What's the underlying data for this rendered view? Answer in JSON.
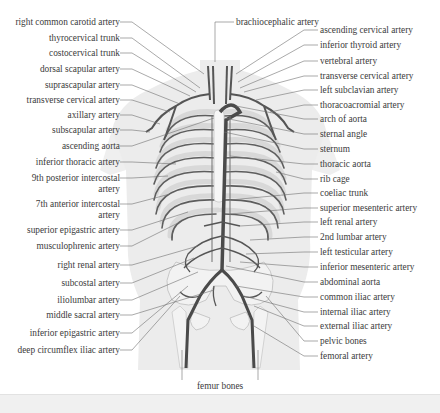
{
  "figure": {
    "colors": {
      "body_silhouette": "#ececec",
      "arteries": "#5a5a5a",
      "bones": "#f4f4f4",
      "bone_outline": "#bdbdbd",
      "leader_lines": "#6a6a6a",
      "text": "#3b3b3b"
    },
    "left_labels": [
      {
        "text": "right common carotid artery",
        "y": 22
      },
      {
        "text": "thyrocervical trunk",
        "y": 38
      },
      {
        "text": "costocervical trunk",
        "y": 53
      },
      {
        "text": "dorsal scapular artery",
        "y": 69
      },
      {
        "text": "suprascapular artery",
        "y": 85
      },
      {
        "text": "transverse cervical artery",
        "y": 100
      },
      {
        "text": "axillary artery",
        "y": 115
      },
      {
        "text": "subscapular artery",
        "y": 130
      },
      {
        "text": "ascending aorta",
        "y": 146
      },
      {
        "text": "inferior thoracic artery",
        "y": 162
      },
      {
        "text": "9th posterior intercostal\nartery",
        "y": 178
      },
      {
        "text": "7th anterior intercostal\nartery",
        "y": 204
      },
      {
        "text": "superior epigastric artery",
        "y": 230
      },
      {
        "text": "musculophrenic artery",
        "y": 246
      },
      {
        "text": "right renal artery",
        "y": 265
      },
      {
        "text": "subcostal artery",
        "y": 283
      },
      {
        "text": "iliolumbar artery",
        "y": 300
      },
      {
        "text": "middle sacral artery",
        "y": 315
      },
      {
        "text": "inferior epigastric artery",
        "y": 333
      },
      {
        "text": "deep circumflex iliac artery",
        "y": 350
      }
    ],
    "right_labels": [
      {
        "text": "ascending cervical artery",
        "y": 30
      },
      {
        "text": "inferior thyroid artery",
        "y": 45
      },
      {
        "text": "vertebral artery",
        "y": 61
      },
      {
        "text": "transverse cervical artery",
        "y": 76
      },
      {
        "text": "left subclavian artery",
        "y": 90
      },
      {
        "text": "thoracoacromial artery",
        "y": 105
      },
      {
        "text": "arch of aorta",
        "y": 119
      },
      {
        "text": "sternal angle",
        "y": 134
      },
      {
        "text": "sternum",
        "y": 149
      },
      {
        "text": "thoracic aorta",
        "y": 164
      },
      {
        "text": "rib cage",
        "y": 179
      },
      {
        "text": "coeliac trunk",
        "y": 193
      },
      {
        "text": "superior mesenteric artery",
        "y": 208
      },
      {
        "text": "left renal artery",
        "y": 222
      },
      {
        "text": "2nd lumbar artery",
        "y": 237
      },
      {
        "text": "left testicular artery",
        "y": 252
      },
      {
        "text": "inferior mesenteric artery",
        "y": 267
      },
      {
        "text": "abdominal aorta",
        "y": 282
      },
      {
        "text": "common iliac artery",
        "y": 297
      },
      {
        "text": "internal iliac artery",
        "y": 312
      },
      {
        "text": "external iliac artery",
        "y": 326
      },
      {
        "text": "pelvic bones",
        "y": 341
      },
      {
        "text": "femoral artery",
        "y": 356
      }
    ],
    "top_label": {
      "text": "brachiocephalic artery"
    },
    "bottom_label": {
      "text": "femur bones"
    }
  }
}
